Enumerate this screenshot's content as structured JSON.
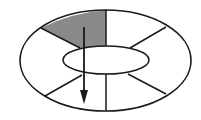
{
  "diagram": {
    "type": "segmented-elliptical-ring",
    "segment_count": 6,
    "segments": [
      {
        "id": "upper-left",
        "shaded": true
      },
      {
        "id": "upper-right",
        "shaded": false
      },
      {
        "id": "right",
        "shaded": false
      },
      {
        "id": "lower-right",
        "shaded": false
      },
      {
        "id": "lower-left",
        "shaded": false
      },
      {
        "id": "left",
        "shaded": false
      }
    ],
    "arrow": {
      "direction": "down"
    },
    "colors": {
      "stroke": "#1a1a1a",
      "shaded_fill": "#8a8a8a",
      "background": "#ffffff"
    }
  }
}
